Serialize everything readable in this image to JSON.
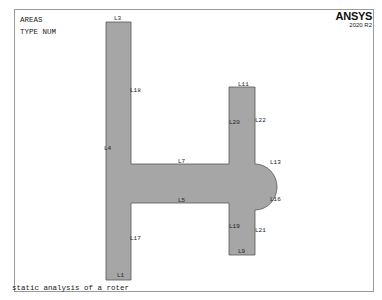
{
  "header": {
    "title": "AREAS",
    "subtitle": "TYPE NUM",
    "brand": "ANSYS",
    "version": "2020 R2"
  },
  "footer": {
    "caption": "static analysis of a roter"
  },
  "colors": {
    "area_fill": "#a6a6a6",
    "area_edge": "#555555",
    "frame": "#9a9a9a"
  },
  "lines": [
    {
      "id": "L1",
      "x": 117,
      "y": 272
    },
    {
      "id": "L3",
      "x": 114,
      "y": 15
    },
    {
      "id": "L4",
      "x": 104,
      "y": 145
    },
    {
      "id": "L5",
      "x": 178,
      "y": 197
    },
    {
      "id": "L7",
      "x": 178,
      "y": 158
    },
    {
      "id": "L9",
      "x": 238,
      "y": 248
    },
    {
      "id": "L11",
      "x": 238,
      "y": 81
    },
    {
      "id": "L13",
      "x": 270,
      "y": 159
    },
    {
      "id": "L16",
      "x": 270,
      "y": 196
    },
    {
      "id": "L17",
      "x": 130,
      "y": 235
    },
    {
      "id": "L18",
      "x": 130,
      "y": 87
    },
    {
      "id": "L19",
      "x": 229,
      "y": 223
    },
    {
      "id": "L20",
      "x": 229,
      "y": 119
    },
    {
      "id": "L21",
      "x": 255,
      "y": 227
    },
    {
      "id": "L22",
      "x": 255,
      "y": 117
    }
  ]
}
